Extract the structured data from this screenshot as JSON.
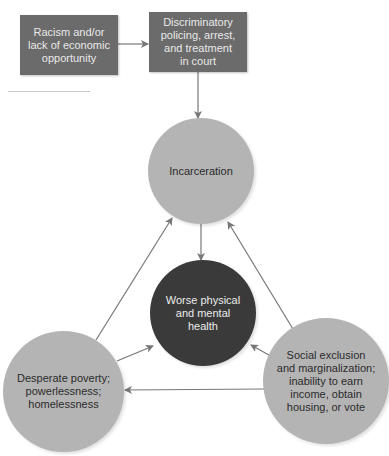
{
  "diagram": {
    "boxes": [
      {
        "id": "racism",
        "label": "Racism and/or\nlack of economic\nopportunity"
      },
      {
        "id": "discriminatory-policing",
        "label": "Discriminatory\npolicing, arrest,\nand treatment\nin court"
      }
    ],
    "nodes": [
      {
        "id": "incarceration",
        "label": "Incarceration",
        "shade": "light"
      },
      {
        "id": "worse-health",
        "label": "Worse physical\nand mental\nhealth",
        "shade": "dark"
      },
      {
        "id": "desperate-poverty",
        "label": "Desperate poverty;\npowerlessness;\nhomelessness",
        "shade": "light"
      },
      {
        "id": "social-exclusion",
        "label": "Social exclusion\nand marginalization;\ninability to earn\nincome, obtain\nhousing, or vote",
        "shade": "light"
      }
    ],
    "edges": [
      {
        "from": "racism",
        "to": "discriminatory-policing"
      },
      {
        "from": "discriminatory-policing",
        "to": "incarceration"
      },
      {
        "from": "incarceration",
        "to": "worse-health"
      },
      {
        "from": "desperate-poverty",
        "to": "incarceration"
      },
      {
        "from": "social-exclusion",
        "to": "incarceration"
      },
      {
        "from": "desperate-poverty",
        "to": "worse-health"
      },
      {
        "from": "social-exclusion",
        "to": "worse-health"
      },
      {
        "from": "social-exclusion",
        "to": "desperate-poverty"
      }
    ],
    "colors": {
      "box": "#6b6b6b",
      "light_node": "#b4b4b4",
      "dark_node": "#3a3a3a",
      "arrow": "#777777"
    }
  }
}
